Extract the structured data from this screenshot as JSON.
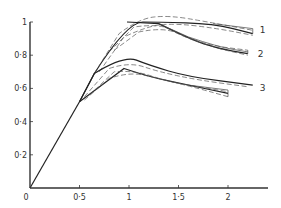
{
  "chart_data": {
    "type": "line",
    "title": "",
    "xlabel": "",
    "ylabel": "",
    "xlim": [
      0,
      2.4
    ],
    "ylim": [
      0,
      1.0
    ],
    "grid": false,
    "legend": "inline series labels at right end of curves",
    "x_ticks": [
      0,
      0.5,
      1,
      1.5,
      2
    ],
    "x_tick_labels": [
      "0",
      "0·5",
      "1",
      "1·5",
      "2"
    ],
    "y_ticks": [
      0.2,
      0.4,
      0.6,
      0.8,
      1.0
    ],
    "y_tick_labels": [
      "0·2",
      "0·4",
      "0·6",
      "0·8",
      "1"
    ],
    "series": [
      {
        "name": "shared-initial",
        "style": "solid",
        "x": [
          0,
          0.5
        ],
        "y": [
          0,
          0.52
        ]
      },
      {
        "name": "1",
        "style": "solid",
        "x": [
          0.5,
          0.65,
          0.98,
          1.3,
          1.85,
          2.25
        ],
        "y": [
          0.52,
          0.69,
          1.0,
          1.0,
          0.99,
          0.93
        ]
      },
      {
        "name": "1",
        "style": "thin",
        "x": [
          1.85,
          2.25
        ],
        "y": [
          0.99,
          0.96
        ]
      },
      {
        "name": "1",
        "style": "dashed",
        "x": [
          0.65,
          0.9,
          1.1,
          1.4,
          1.8,
          2.25
        ],
        "y": [
          0.69,
          0.93,
          1.02,
          1.04,
          1.0,
          0.95
        ]
      },
      {
        "name": "1",
        "style": "dashed",
        "x": [
          0.7,
          0.95,
          1.2,
          1.5,
          1.9,
          2.25
        ],
        "y": [
          0.7,
          0.91,
          0.98,
          0.99,
          0.96,
          0.92
        ]
      },
      {
        "name": "2",
        "style": "solid",
        "x": [
          0.98,
          1.3,
          1.6,
          1.9,
          2.2
        ],
        "y": [
          1.0,
          0.99,
          0.9,
          0.84,
          0.81
        ]
      },
      {
        "name": "2",
        "style": "thin",
        "x": [
          1.3,
          1.6,
          1.9,
          2.2
        ],
        "y": [
          0.99,
          0.91,
          0.85,
          0.82
        ]
      },
      {
        "name": "2",
        "style": "dashed",
        "x": [
          0.8,
          1.05,
          1.3,
          1.5,
          1.8,
          2.2
        ],
        "y": [
          0.82,
          0.97,
          0.99,
          0.93,
          0.86,
          0.83
        ]
      },
      {
        "name": "2",
        "style": "dashed",
        "x": [
          0.85,
          1.1,
          1.35,
          1.6,
          1.9,
          2.2
        ],
        "y": [
          0.83,
          0.94,
          0.97,
          0.9,
          0.84,
          0.8
        ]
      },
      {
        "name": "3",
        "style": "solid",
        "x": [
          0.5,
          0.65,
          0.95,
          1.2,
          1.6,
          2.25
        ],
        "y": [
          0.52,
          0.69,
          0.8,
          0.74,
          0.67,
          0.62
        ]
      },
      {
        "name": "3",
        "style": "solid",
        "x": [
          0.5,
          0.95,
          1.2,
          1.6,
          2.0
        ],
        "y": [
          0.52,
          0.72,
          0.67,
          0.62,
          0.57
        ]
      },
      {
        "name": "3",
        "style": "thin",
        "x": [
          1.6,
          2.0
        ],
        "y": [
          0.62,
          0.59
        ]
      },
      {
        "name": "3",
        "style": "dashed",
        "x": [
          0.55,
          0.8,
          1.0,
          1.3,
          1.7,
          2.2
        ],
        "y": [
          0.55,
          0.72,
          0.76,
          0.7,
          0.65,
          0.61
        ]
      },
      {
        "name": "3",
        "style": "dashed",
        "x": [
          0.55,
          0.8,
          1.0,
          1.3,
          1.7,
          2.0
        ],
        "y": [
          0.53,
          0.66,
          0.7,
          0.66,
          0.6,
          0.55
        ]
      },
      {
        "name": "3",
        "style": "dashed",
        "x": [
          0.6,
          0.85,
          1.05,
          1.4,
          1.7,
          2.0
        ],
        "y": [
          0.56,
          0.7,
          0.71,
          0.64,
          0.61,
          0.58
        ]
      }
    ],
    "series_labels": [
      {
        "text": "1",
        "x": 2.32,
        "y": 0.95
      },
      {
        "text": "2",
        "x": 2.3,
        "y": 0.81
      },
      {
        "text": "3",
        "x": 2.32,
        "y": 0.6
      }
    ]
  }
}
